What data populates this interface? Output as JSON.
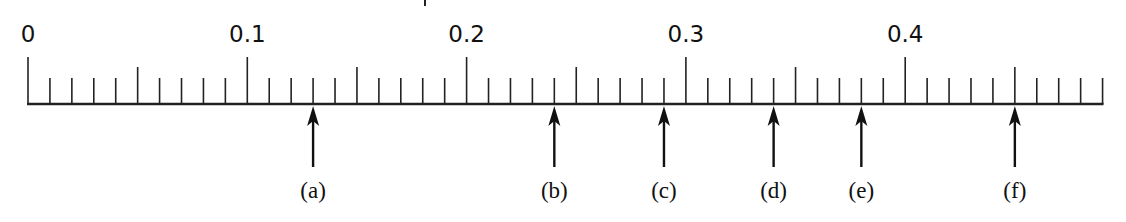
{
  "diagram": {
    "type": "number-line",
    "axis": {
      "min": 0,
      "max": 0.49,
      "minor_step": 0.01,
      "medium_step": 0.05,
      "major_step": 0.1,
      "major_labels": [
        "0",
        "0.1",
        "0.2",
        "0.3",
        "0.4"
      ],
      "color": "#222222"
    },
    "arrows": [
      {
        "label": "(a)",
        "value": 0.13
      },
      {
        "label": "(b)",
        "value": 0.24
      },
      {
        "label": "(c)",
        "value": 0.29
      },
      {
        "label": "(d)",
        "value": 0.34
      },
      {
        "label": "(e)",
        "value": 0.38
      },
      {
        "label": "(f)",
        "value": 0.45
      }
    ]
  },
  "layout": {
    "x0": 28,
    "px_per_unit": 2193,
    "baseline_y": 104,
    "major_top_y": 57,
    "medium_top_y": 67,
    "minor_top_y": 78,
    "label_baseline_y": 42,
    "arrow_tip_y": 106,
    "arrow_tail_y": 167,
    "arrow_label_y": 198
  }
}
